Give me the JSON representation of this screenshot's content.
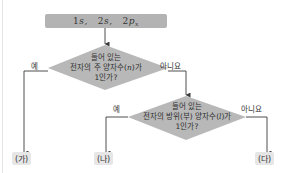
{
  "start": {
    "orbitals": [
      {
        "label": "1s",
        "main": "1",
        "letter": "s",
        "sub": ""
      },
      {
        "label": "2s",
        "main": "2",
        "letter": "s",
        "sub": ""
      },
      {
        "label": "2p_x",
        "main": "2",
        "letter": "p",
        "sub": "x"
      }
    ],
    "separator": ","
  },
  "decision1": {
    "line1": "들어 있는",
    "line2_prefix": "전자의 주 양자수(",
    "line2_var": "n",
    "line2_suffix": ")가",
    "line3": "1인가?",
    "yes_label": "예",
    "no_label": "아니요"
  },
  "decision2": {
    "line1": "들어 있는",
    "line2_prefix": "전자의 방위(부) 양자수(",
    "line2_var": "l",
    "line2_suffix": ")가",
    "line3": "1인가?",
    "yes_label": "예",
    "no_label": "아니요"
  },
  "results": {
    "ga": "(가)",
    "na": "(나)",
    "da": "(다)"
  },
  "colors": {
    "box_fill": "#b3b3b3",
    "diamond_fill": "#b8b8b8",
    "line": "#3a3a3a",
    "result_fill": "#e6e6e6"
  }
}
